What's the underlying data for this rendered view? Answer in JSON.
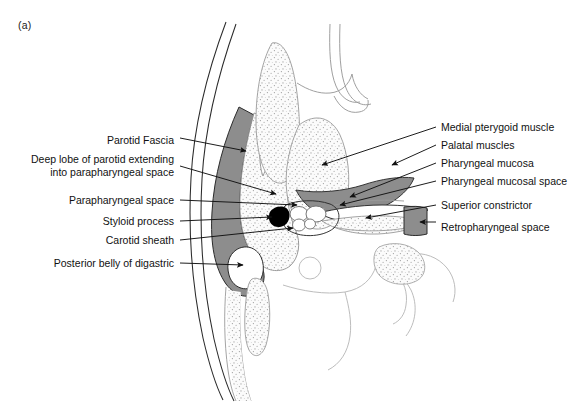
{
  "figure": {
    "panel_label": "(a)",
    "caption_hidden": "",
    "domain": "anatomical line diagram",
    "view": "axial cross-section through the parapharyngeal space"
  },
  "labels_left": [
    {
      "id": "parotid-fascia",
      "text": "Parotid Fascia",
      "y": 140,
      "lines": 1
    },
    {
      "id": "deep-lobe-parotid",
      "text": "Deep lobe of parotid extending\ninto parapharyngeal space",
      "y": 165,
      "lines": 2
    },
    {
      "id": "parapharyngeal-space",
      "text": "Parapharyngeal space",
      "y": 200,
      "lines": 1
    },
    {
      "id": "styloid-process",
      "text": "Styloid process",
      "y": 221,
      "lines": 1
    },
    {
      "id": "carotid-sheath",
      "text": "Carotid sheath",
      "y": 240,
      "lines": 1
    },
    {
      "id": "posterior-belly-digastric",
      "text": "Posterior belly of digastric",
      "y": 263,
      "lines": 1
    }
  ],
  "labels_right": [
    {
      "id": "medial-pterygoid-muscle",
      "text": "Medial pterygoid muscle",
      "y": 127
    },
    {
      "id": "palatal-muscles",
      "text": "Palatal muscles",
      "y": 145
    },
    {
      "id": "pharyngeal-mucosa",
      "text": "Pharyngeal mucosa",
      "y": 163
    },
    {
      "id": "pharyngeal-mucosal-space",
      "text": "Pharyngeal mucosal space",
      "y": 181
    },
    {
      "id": "superior-constrictor",
      "text": "Superior constrictor",
      "y": 205
    },
    {
      "id": "retropharyngeal-space",
      "text": " Retropharyngeal space",
      "y": 227
    }
  ],
  "colors": {
    "ink": "#111111",
    "outline_dark": "#2b2b2b",
    "outline_light": "#9a9a9a",
    "fascia_gray": "#8d8d8d",
    "stipple_fill": "#f2f2f2",
    "styloid_black": "#000000",
    "background": "#ffffff"
  }
}
